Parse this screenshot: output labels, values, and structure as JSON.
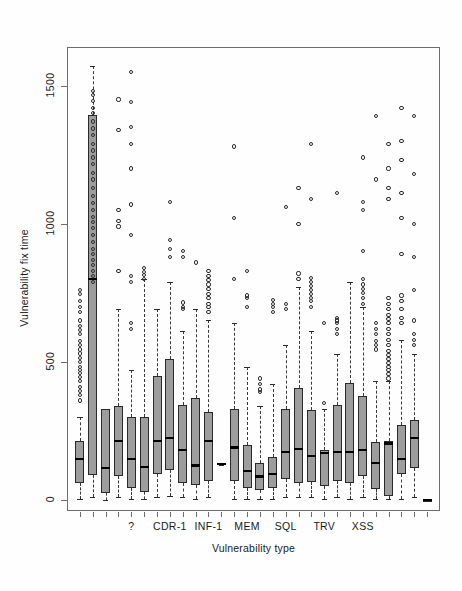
{
  "chart_data": {
    "type": "boxplot",
    "title": "",
    "xlabel": "Vulnerability type",
    "ylabel": "Vulnerability fix time",
    "ylim": [
      -40,
      1640
    ],
    "yticks": [
      0,
      500,
      1000,
      1500
    ],
    "ytick_labels": [
      "0",
      "500",
      "1000",
      "1500"
    ],
    "grid": false,
    "legend": null,
    "n_groups": 28,
    "xtick_labels_shown": [
      "?",
      "CDR-1",
      "INF-1",
      "MEM",
      "SQL",
      "TRV",
      "XSS"
    ],
    "xtick_label_positions": [
      5,
      8,
      11,
      14,
      17,
      20,
      23
    ],
    "box_fill": "#9d9d9d",
    "box_border": "#2a2a2a",
    "median_color": "#000000",
    "whisker_style": "dashed",
    "boxes": [
      {
        "index": 1,
        "q1": 60,
        "median": 150,
        "q3": 215,
        "wlo": 5,
        "whi": 300,
        "outliers": [
          360,
          380,
          395,
          410,
          430,
          445,
          460,
          470,
          480,
          500,
          515,
          530,
          545,
          560,
          575,
          600,
          615,
          630,
          650,
          680,
          700,
          720,
          745,
          760
        ]
      },
      {
        "index": 2,
        "q1": 90,
        "median": 800,
        "q3": 1395,
        "wlo": 10,
        "whi": 1570,
        "outliers": [
          790,
          810,
          830,
          850,
          870,
          890,
          910,
          935,
          960,
          985,
          1005,
          1025,
          1050,
          1075,
          1100,
          1130,
          1160,
          1185,
          1215,
          1240,
          1265,
          1290,
          1320,
          1345,
          1370,
          1400,
          1420,
          1445,
          1465,
          1480
        ]
      },
      {
        "index": 3,
        "q1": 25,
        "median": 115,
        "q3": 330,
        "wlo": 0,
        "whi": 330,
        "outliers": []
      },
      {
        "index": 4,
        "q1": 85,
        "median": 215,
        "q3": 340,
        "wlo": 10,
        "whi": 690,
        "outliers": [
          830,
          990,
          1010,
          1050,
          1340,
          1450
        ]
      },
      {
        "index": 5,
        "q1": 45,
        "median": 150,
        "q3": 300,
        "wlo": 5,
        "whi": 470,
        "outliers": [
          620,
          640,
          790,
          810,
          960,
          1070,
          1200,
          1290,
          1350,
          1440,
          1550
        ]
      },
      {
        "index": 6,
        "q1": 30,
        "median": 120,
        "q3": 300,
        "wlo": 5,
        "whi": 800,
        "outliers": [
          800,
          815,
          825,
          840
        ]
      },
      {
        "index": 7,
        "q1": 95,
        "median": 215,
        "q3": 450,
        "wlo": 10,
        "whi": 690,
        "outliers": []
      },
      {
        "index": 8,
        "q1": 110,
        "median": 225,
        "q3": 510,
        "wlo": 15,
        "whi": 790,
        "outliers": [
          880,
          910,
          940,
          1080
        ]
      },
      {
        "index": 9,
        "q1": 60,
        "median": 180,
        "q3": 345,
        "wlo": 10,
        "whi": 610,
        "outliers": [
          690,
          700,
          715,
          880,
          900
        ]
      },
      {
        "index": 10,
        "q1": 55,
        "median": 125,
        "q3": 370,
        "wlo": 5,
        "whi": 690,
        "outliers": [
          860
        ]
      },
      {
        "index": 11,
        "q1": 70,
        "median": 215,
        "q3": 320,
        "wlo": 10,
        "whi": 650,
        "outliers": [
          680,
          700,
          710,
          730,
          745,
          765,
          780,
          795,
          810,
          830
        ]
      },
      {
        "index": 12,
        "q1": 130,
        "median": 130,
        "q3": 135,
        "wlo": 125,
        "whi": 135,
        "outliers": []
      },
      {
        "index": 13,
        "q1": 70,
        "median": 190,
        "q3": 330,
        "wlo": 5,
        "whi": 640,
        "outliers": [
          800,
          1020,
          1280
        ]
      },
      {
        "index": 14,
        "q1": 45,
        "median": 105,
        "q3": 200,
        "wlo": 5,
        "whi": 480,
        "outliers": [
          700,
          730,
          740,
          830
        ]
      },
      {
        "index": 15,
        "q1": 35,
        "median": 85,
        "q3": 135,
        "wlo": 5,
        "whi": 340,
        "outliers": [
          390,
          400,
          420,
          440
        ]
      },
      {
        "index": 16,
        "q1": 45,
        "median": 95,
        "q3": 155,
        "wlo": 5,
        "whi": 420,
        "outliers": [
          680,
          700,
          710,
          725
        ]
      },
      {
        "index": 17,
        "q1": 75,
        "median": 175,
        "q3": 330,
        "wlo": 10,
        "whi": 560,
        "outliers": [
          690,
          710,
          1060
        ]
      },
      {
        "index": 18,
        "q1": 60,
        "median": 185,
        "q3": 405,
        "wlo": 10,
        "whi": 770,
        "outliers": [
          800,
          820,
          1000,
          1130
        ]
      },
      {
        "index": 19,
        "q1": 65,
        "median": 160,
        "q3": 325,
        "wlo": 10,
        "whi": 610,
        "outliers": [
          700,
          720,
          730,
          745,
          760,
          775,
          790,
          805,
          1090,
          1290
        ]
      },
      {
        "index": 20,
        "q1": 50,
        "median": 170,
        "q3": 180,
        "wlo": 5,
        "whi": 330,
        "outliers": [
          350,
          640
        ]
      },
      {
        "index": 21,
        "q1": 70,
        "median": 175,
        "q3": 345,
        "wlo": 10,
        "whi": 530,
        "outliers": [
          600,
          620,
          640,
          650,
          660,
          1110
        ]
      },
      {
        "index": 22,
        "q1": 60,
        "median": 175,
        "q3": 425,
        "wlo": 5,
        "whi": 790,
        "outliers": []
      },
      {
        "index": 23,
        "q1": 85,
        "median": 180,
        "q3": 375,
        "wlo": 10,
        "whi": 700,
        "outliers": [
          710,
          730,
          750,
          765,
          780,
          800,
          900,
          1050,
          1080,
          1240
        ]
      },
      {
        "index": 24,
        "q1": 40,
        "median": 135,
        "q3": 210,
        "wlo": 5,
        "whi": 430,
        "outliers": [
          545,
          560,
          575,
          600,
          620,
          640,
          1160,
          1390
        ]
      },
      {
        "index": 25,
        "q1": 15,
        "median": 205,
        "q3": 215,
        "wlo": 5,
        "whi": 430,
        "outliers": [
          440,
          455,
          470,
          480,
          495,
          510,
          525,
          540,
          560,
          580,
          600,
          620,
          640,
          655,
          670,
          690,
          710,
          730,
          1090,
          1130,
          1200,
          1290
        ]
      },
      {
        "index": 26,
        "q1": 95,
        "median": 150,
        "q3": 270,
        "wlo": 5,
        "whi": 580,
        "outliers": [
          640,
          660,
          690,
          720,
          740,
          890,
          1020,
          1110,
          1230,
          1300,
          1420
        ]
      },
      {
        "index": 27,
        "q1": 115,
        "median": 225,
        "q3": 290,
        "wlo": 10,
        "whi": 530,
        "outliers": [
          560,
          580,
          600,
          650,
          760,
          880,
          1000,
          1180,
          1390
        ]
      },
      {
        "index": 28,
        "q1": 0,
        "median": 0,
        "q3": 0,
        "wlo": 0,
        "whi": 0,
        "outliers": []
      }
    ]
  }
}
